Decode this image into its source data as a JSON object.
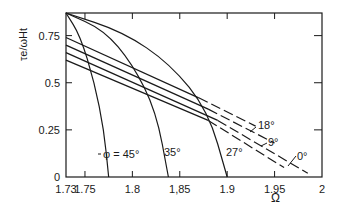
{
  "chart_data": {
    "type": "line",
    "title": "",
    "xlabel": "Ω",
    "ylabel": "τ_e/ω_H t",
    "xlim": [
      1.73,
      2.0
    ],
    "ylim": [
      0,
      0.87
    ],
    "x_ticks": [
      1.73,
      1.75,
      1.8,
      1.85,
      1.9,
      1.95,
      2.0
    ],
    "x_tick_labels": [
      "1.73",
      "1.75",
      "1.8",
      "1,85",
      "1.9",
      "1.95",
      "2"
    ],
    "y_ticks": [
      0,
      0.25,
      0.5,
      0.75
    ],
    "y_tick_labels": [
      "0",
      "0.25",
      "0.5",
      "0.75"
    ],
    "grid": false,
    "legend": "inline labels",
    "series_phi": [
      {
        "name": "φ = 45°",
        "label": "φ=45°",
        "style": "solid",
        "x": [
          1.73,
          1.745,
          1.76,
          1.77,
          1.775
        ],
        "y": [
          0.87,
          0.75,
          0.5,
          0.25,
          0
        ]
      },
      {
        "name": "35°",
        "label": "35°",
        "style": "solid",
        "x": [
          1.73,
          1.77,
          1.8,
          1.825,
          1.838
        ],
        "y": [
          0.87,
          0.78,
          0.6,
          0.35,
          0
        ]
      },
      {
        "name": "27°",
        "label": "27°",
        "style": "solid",
        "x": [
          1.73,
          1.79,
          1.84,
          1.88,
          1.9
        ],
        "y": [
          0.87,
          0.77,
          0.6,
          0.35,
          0
        ]
      }
    ],
    "series_lines": [
      {
        "name": "18°",
        "label": "18°",
        "x_solid": [
          1.73,
          1.87
        ],
        "y_solid": [
          0.74,
          0.42
        ],
        "x_dash": [
          1.87,
          1.93
        ],
        "y_dash": [
          0.42,
          0.27
        ]
      },
      {
        "name": "9°",
        "label": "9°",
        "x_solid": [
          1.73,
          1.88
        ],
        "y_solid": [
          0.7,
          0.36
        ],
        "x_dash": [
          1.88,
          1.95
        ],
        "y_dash": [
          0.36,
          0.18
        ]
      },
      {
        "name": "0°",
        "label": "0°",
        "x_solid": [
          1.73,
          1.89
        ],
        "y_solid": [
          0.66,
          0.3
        ],
        "x_dash": [
          1.89,
          1.985
        ],
        "y_dash": [
          0.3,
          0.02
        ]
      },
      {
        "name": "line-4",
        "label": "",
        "x_solid": [
          1.73,
          1.88
        ],
        "y_solid": [
          0.62,
          0.3
        ],
        "x_dash": [
          1.88,
          1.96
        ],
        "y_dash": [
          0.3,
          0.05
        ]
      }
    ],
    "annotations": [
      "φ=45°",
      "35°",
      "27°",
      "18°",
      "9°",
      "0°"
    ]
  },
  "labels": {
    "ylabel": "τe/ωHt",
    "xlabel": "Ω",
    "phi45": "φ = 45°",
    "phi35": "35°",
    "phi27": "27°",
    "phi18": "18°",
    "phi9": "9°",
    "phi0": "0°"
  }
}
